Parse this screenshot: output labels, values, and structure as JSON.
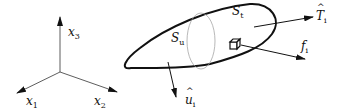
{
  "diagram": {
    "type": "continuum-body-boundary-conditions",
    "axes": {
      "x1": {
        "label": "x",
        "sub": "1"
      },
      "x2": {
        "label": "x",
        "sub": "2"
      },
      "x3": {
        "label": "x",
        "sub": "3"
      }
    },
    "body": {
      "surface_displacement": {
        "label": "S",
        "sub": "u"
      },
      "surface_traction": {
        "label": "S",
        "sub": "t"
      }
    },
    "vectors": {
      "prescribed_displacement": {
        "label": "u",
        "sub": "i",
        "hat": true
      },
      "prescribed_traction": {
        "label": "T",
        "sub": "i",
        "hat": true
      },
      "body_force": {
        "label": "f",
        "sub": "i",
        "hat": false
      }
    },
    "colors": {
      "line": "#111111",
      "dotted": "#999999",
      "background": "#ffffff"
    }
  }
}
